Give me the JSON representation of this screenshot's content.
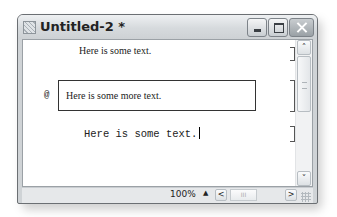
{
  "window": {
    "title": "Untitled-2 *",
    "icon": "app-document-icon"
  },
  "caption_buttons": {
    "minimize": "minimize-icon",
    "maximize": "maximize-icon",
    "close": "close-icon"
  },
  "document": {
    "paragraphs": [
      {
        "text": "Here is some text.",
        "font": "serif"
      },
      {
        "marker": "@",
        "text": "Here is some more text.",
        "font": "serif",
        "boxed": true
      },
      {
        "text": "Here is some text.",
        "font": "monospace",
        "has_caret": true
      }
    ]
  },
  "scrollbar": {
    "up": "˄",
    "down": "˅"
  },
  "status": {
    "zoom": "100%",
    "zoom_up": "▲",
    "scroll_left": "<",
    "scroll_right": ">",
    "thumb_grip": "III"
  }
}
